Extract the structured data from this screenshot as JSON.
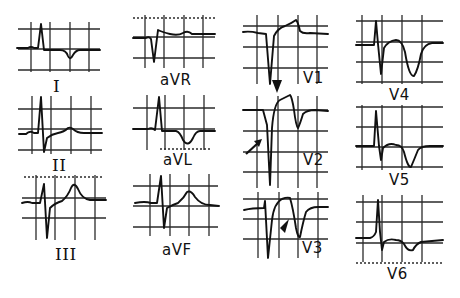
{
  "figure": {
    "layout": "4 columns",
    "columns": [
      [
        "I",
        "II",
        "III"
      ],
      [
        "aVR",
        "aVL",
        "aVF"
      ],
      [
        "V1",
        "V2",
        "V3"
      ],
      [
        "V4",
        "V5",
        "V6"
      ]
    ]
  },
  "leads": {
    "I": {
      "label": "I"
    },
    "II": {
      "label": "II"
    },
    "III": {
      "label": "III"
    },
    "aVR": {
      "label": "aVR"
    },
    "aVL": {
      "label": "aVL"
    },
    "aVF": {
      "label": "aVF"
    },
    "V1": {
      "label": "V1"
    },
    "V2": {
      "label": "V2"
    },
    "V3": {
      "label": "V3"
    },
    "V4": {
      "label": "V4"
    },
    "V5": {
      "label": "V5"
    },
    "V6": {
      "label": "V6"
    }
  },
  "annotations": [
    {
      "type": "arrowhead",
      "lead": "V1",
      "direction": "down",
      "note": "pointing to ST segment of V2"
    },
    {
      "type": "arrow",
      "lead": "V2",
      "direction": "up-right",
      "note": "pointing to QS complex"
    },
    {
      "type": "arrowhead",
      "lead": "V3",
      "direction": "up-left",
      "note": "pointing to ST-T"
    }
  ],
  "colors": {
    "ink": "#111111",
    "background": "#ffffff"
  }
}
